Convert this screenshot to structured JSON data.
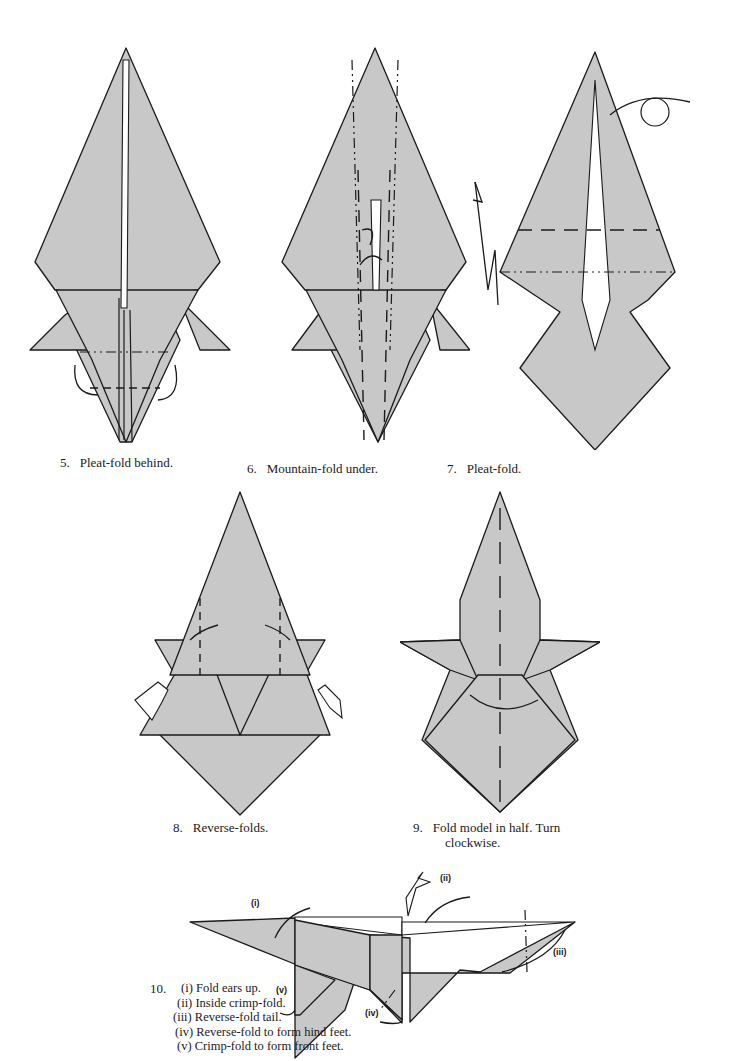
{
  "page": {
    "background": "#ffffff",
    "paper_color": "#c8c8c8",
    "line_color": "#1a1a1a"
  },
  "steps": [
    {
      "number": "5.",
      "caption": "Pleat-fold behind."
    },
    {
      "number": "6.",
      "caption": "Mountain-fold under."
    },
    {
      "number": "7.",
      "caption": "Pleat-fold."
    },
    {
      "number": "8.",
      "caption": "Reverse-folds."
    },
    {
      "number": "9.",
      "caption_line1": "Fold model in half. Turn",
      "caption_line2": "clockwise."
    },
    {
      "number": "10.",
      "substeps": [
        "(i) Fold ears up.",
        "(ii) Inside crimp-fold.",
        "(iii) Reverse-fold tail.",
        "(iv) Reverse-fold to form hind feet.",
        "(v) Crimp-fold to form front feet."
      ],
      "labels": [
        "(i)",
        "(ii)",
        "(iii)",
        "(iv)",
        "(v)"
      ]
    }
  ]
}
